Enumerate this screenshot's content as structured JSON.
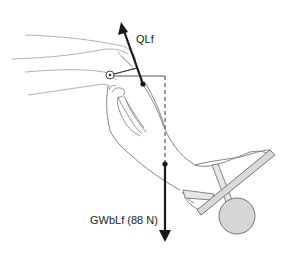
{
  "figure": {
    "labels": {
      "quadriceps_force": "QLf",
      "gravity_weight_force": "GWbLf (88 N)"
    },
    "colors": {
      "force_arrow": "#1a1a1a",
      "outline": "#7a7a7a",
      "light_outline": "#a8a8a8",
      "weight_fill": "#d6d6d6",
      "strap_fill": "#e6e6e6",
      "background": "#ffffff"
    },
    "forces": [
      {
        "name": "QLf",
        "direction": "up-left",
        "line": "solid"
      },
      {
        "name": "GWbLf",
        "magnitude": "88 N",
        "direction": "down",
        "line": "solid"
      }
    ],
    "moment_arm_lines": [
      "solid horizontal from knee axis",
      "dashed vertical to weight line"
    ]
  }
}
